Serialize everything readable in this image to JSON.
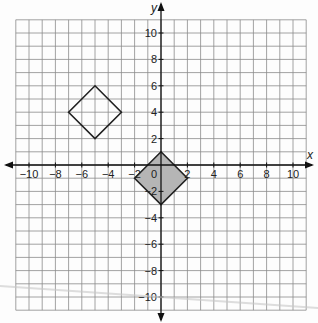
{
  "diagram": {
    "type": "coordinate-grid",
    "x_axis": {
      "label": "x",
      "min": -11,
      "max": 11,
      "tick_labels": [
        "-10",
        "-8",
        "-6",
        "-4",
        "-2",
        "2",
        "4",
        "6",
        "8",
        "10"
      ]
    },
    "y_axis": {
      "label": "y",
      "min": -11,
      "max": 11,
      "tick_labels": [
        "10",
        "8",
        "6",
        "4",
        "2",
        "-2",
        "-4",
        "-6",
        "-8",
        "-10"
      ]
    },
    "origin_label": "0",
    "shapes": [
      {
        "name": "unshaded-square",
        "vertices": [
          [
            -5,
            6
          ],
          [
            -3,
            4
          ],
          [
            -5,
            2
          ],
          [
            -7,
            4
          ]
        ],
        "fill": "none",
        "stroke": "#222222"
      },
      {
        "name": "shaded-square",
        "vertices": [
          [
            0,
            1
          ],
          [
            2,
            -1
          ],
          [
            0,
            -3
          ],
          [
            -2,
            -1
          ]
        ],
        "fill": "#b5b5b5",
        "stroke": "#222222"
      }
    ],
    "colors": {
      "grid": "#8a8a8a",
      "axis": "#111111",
      "shaded": "#b5b5b5"
    }
  }
}
